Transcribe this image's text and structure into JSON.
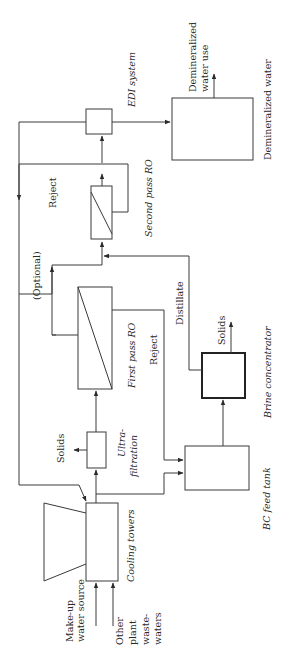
{
  "diagram": {
    "type": "process-flow",
    "orientation": "rotated-90-ccw",
    "units": {
      "edi": {
        "label": "EDI system"
      },
      "demin_tank": {
        "label": "Demineralized water",
        "output": "Demineralized water use"
      },
      "second_ro": {
        "label": "Second pass RO",
        "reject_label": "Reject"
      },
      "first_ro": {
        "label": "First pass RO",
        "reject_label": "Reject",
        "optional_label": "(Optional)"
      },
      "brine_concentrator": {
        "label": "Brine concentrator",
        "solids_label": "Solids",
        "distillate_label": "Distillate"
      },
      "ultrafiltration": {
        "label_line1": "Ultra-",
        "label_line2": "filtration",
        "solids_label": "Solids"
      },
      "bc_feed_tank": {
        "label": "BC feed tank"
      },
      "cooling_towers": {
        "label": "Cooling towers"
      }
    },
    "inputs": {
      "makeup_line1": "Make-up",
      "makeup_line2": "water source",
      "other_line1": "Other",
      "other_line2": "plant",
      "other_line3": "waste-",
      "other_line4": "waters"
    },
    "colors": {
      "line": "#3a3a3a",
      "background": "#ffffff"
    }
  }
}
